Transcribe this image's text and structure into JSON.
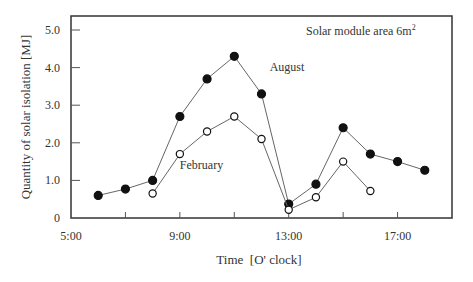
{
  "chart_data": {
    "type": "line",
    "title": "",
    "annotation": "Solar module area 6m",
    "annotation_superscript": "2",
    "xlabel": "Time  [O' clock]",
    "ylabel": "Quantity of solar isolation [MJ]",
    "xlim": [
      5,
      19
    ],
    "ylim": [
      0,
      5.0
    ],
    "x_ticks": [
      5,
      7,
      9,
      11,
      13,
      15,
      17
    ],
    "x_tick_labels": [
      "5:00",
      "",
      "9:00",
      "",
      "13:00",
      "",
      "17:00"
    ],
    "y_ticks": [
      0,
      1.0,
      2.0,
      3.0,
      4.0,
      5.0
    ],
    "y_tick_labels": [
      "0",
      "1.0",
      "2.0",
      "3.0",
      "4.0",
      "5.0"
    ],
    "grid": false,
    "series": [
      {
        "name": "August",
        "marker": "filled-circle",
        "x": [
          6,
          7,
          8,
          9,
          10,
          11,
          12,
          13,
          14,
          15,
          16,
          17,
          18
        ],
        "values": [
          0.6,
          0.77,
          1.0,
          2.7,
          3.7,
          4.3,
          3.3,
          0.37,
          0.9,
          2.4,
          1.7,
          1.5,
          1.27
        ]
      },
      {
        "name": "February",
        "marker": "open-circle",
        "x": [
          8,
          9,
          10,
          11,
          12,
          13,
          14,
          15,
          16
        ],
        "values": [
          0.65,
          1.7,
          2.3,
          2.7,
          2.1,
          0.22,
          0.55,
          1.5,
          0.72
        ]
      }
    ],
    "series_labels": [
      {
        "text": "August",
        "x": 12.3,
        "y": 3.9
      },
      {
        "text": "February",
        "x": 9.0,
        "y": 1.3
      }
    ]
  }
}
